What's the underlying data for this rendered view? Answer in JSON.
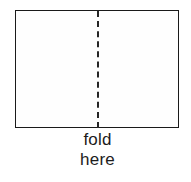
{
  "diagram": {
    "background_color": "#ffffff",
    "shape": {
      "name": "paper-rectangle",
      "kind": "rectangle",
      "stroke_color": "#1a1a1a",
      "fill_color": "#fefefe",
      "stroke_width_px": 1.6,
      "x": 15,
      "y": 10,
      "width": 164,
      "height": 118
    },
    "fold_line": {
      "name": "fold-line",
      "kind": "vertical-dashed-line",
      "stroke_color": "#262626",
      "stroke_width_px": 2,
      "dash_length_px": 7,
      "gap_length_px": 5,
      "x": 97,
      "y_start": 11,
      "y_end": 128
    },
    "caption": {
      "name": "fold-caption",
      "align": "center",
      "text_color": "#1c1c1c",
      "font_size_px": 17,
      "lines": [
        "fold",
        "here"
      ]
    }
  }
}
